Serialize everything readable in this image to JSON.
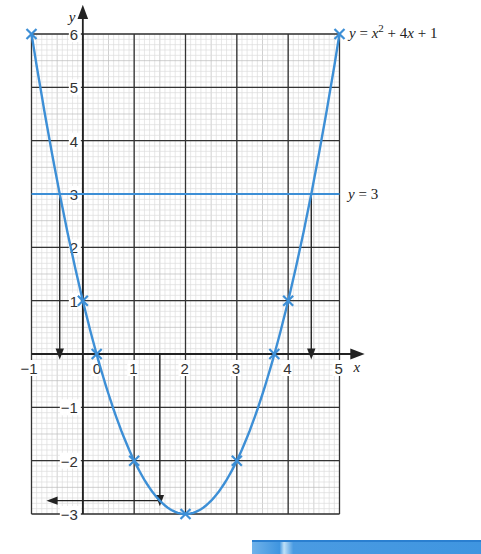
{
  "chart_data": {
    "type": "line",
    "title": "",
    "xlabel": "x",
    "ylabel": "y",
    "xlim": [
      -1,
      5
    ],
    "ylim": [
      -3,
      6
    ],
    "grid": true,
    "x_ticks": [
      "-1",
      "0",
      "1",
      "2",
      "3",
      "4",
      "5"
    ],
    "y_ticks": [
      "6",
      "5",
      "4",
      "3",
      "2",
      "1",
      "-1",
      "-2",
      "-3"
    ],
    "series": [
      {
        "name": "y = x² + 4x + 1",
        "label_text": {
          "y": "y",
          "eq": " = ",
          "x": "x",
          "sup": "2",
          "rest": " + 4",
          "x2": "x",
          "tail": " + 1"
        },
        "color": "#3d8fd6",
        "marked_points": [
          {
            "x": -1,
            "y": 6
          },
          {
            "x": 0,
            "y": 1
          },
          {
            "x": 0.27,
            "y": 0
          },
          {
            "x": 1,
            "y": -2
          },
          {
            "x": 2,
            "y": -3
          },
          {
            "x": 3,
            "y": -2
          },
          {
            "x": 3.73,
            "y": 0
          },
          {
            "x": 4,
            "y": 1
          },
          {
            "x": 5,
            "y": 6
          }
        ]
      },
      {
        "name": "y = 3",
        "label_text": {
          "y": "y",
          "rest": " = 3"
        },
        "color": "#3d8fd6",
        "values": [
          {
            "x": -1,
            "y": 3
          },
          {
            "x": 5,
            "y": 3
          }
        ]
      }
    ],
    "annotations": [
      {
        "type": "dropline",
        "from": {
          "x": -0.45,
          "y": 3
        },
        "to": {
          "x": -0.45,
          "y": 0
        }
      },
      {
        "type": "dropline",
        "from": {
          "x": 4.45,
          "y": 3
        },
        "to": {
          "x": 4.45,
          "y": 0
        }
      },
      {
        "type": "dropline",
        "from": {
          "x": 1.5,
          "y": 0
        },
        "to": {
          "x": 1.5,
          "y": -2.75
        }
      },
      {
        "type": "arrow-left",
        "from": {
          "x": 1.5,
          "y": -2.75
        },
        "to": {
          "x": -0.6,
          "y": -2.75
        }
      }
    ]
  }
}
